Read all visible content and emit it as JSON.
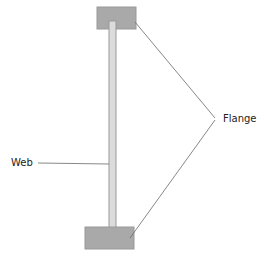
{
  "diagram": {
    "type": "I-beam cross-section",
    "labels": {
      "web": "Web",
      "flange": "Flange"
    },
    "colors": {
      "flange_fill": "#a9a9a9",
      "web_fill": "#dcdcdc",
      "outline": "#8a8a8a",
      "leader": "#6a6a6a",
      "text": "#222222"
    }
  }
}
